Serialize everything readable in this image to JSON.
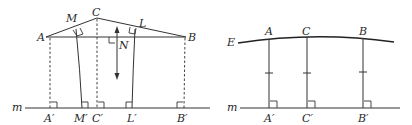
{
  "left_figure": {
    "points": {
      "A": "A",
      "C": "C",
      "B": "B",
      "M": "M",
      "L": "L",
      "N": "N",
      "A_prime": "A′",
      "M_prime": "M′",
      "C_prime": "C′",
      "L_prime": "L′",
      "B_prime": "B′"
    },
    "line_label": "m",
    "arrow": "double-headed vertical arrow"
  },
  "right_figure": {
    "curve_label": "E",
    "points": {
      "A": "A",
      "C": "C",
      "B": "B",
      "A_prime": "A′",
      "C_prime": "C′",
      "B_prime": "B′"
    },
    "line_label": "m"
  },
  "colors": {
    "stroke": "#333333",
    "text": "#2a2a2a",
    "background": "#ffffff"
  }
}
